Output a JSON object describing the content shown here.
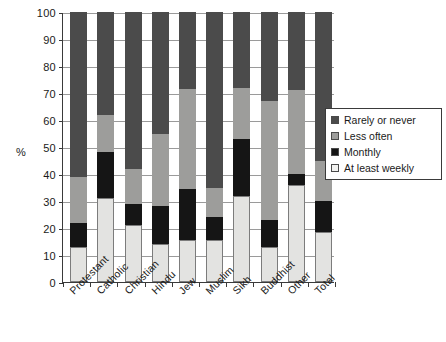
{
  "chart_data": {
    "type": "bar",
    "subtype": "stacked-bar-100",
    "title": "",
    "xlabel": "",
    "ylabel": "%",
    "ylim": [
      0,
      100
    ],
    "ytick_step": 10,
    "yticks": [
      100,
      90,
      80,
      70,
      60,
      50,
      40,
      30,
      20,
      10,
      0
    ],
    "grid": true,
    "legend_position": "right",
    "categories": [
      "Protestant",
      "Catholic",
      "Christian",
      "Hindu",
      "Jew",
      "Muslim",
      "Sikh",
      "Buddhist",
      "Other",
      "Total"
    ],
    "series": [
      {
        "name": "At least weekly",
        "color": "#e3e3e1",
        "values": [
          13,
          31,
          21,
          14,
          15.5,
          15.5,
          32,
          13,
          36,
          18.5
        ]
      },
      {
        "name": "Monthly",
        "color": "#151515",
        "values": [
          9,
          17,
          8,
          14,
          19,
          8.5,
          21,
          10,
          4,
          11.5
        ]
      },
      {
        "name": "Less often",
        "color": "#9d9d9b",
        "values": [
          17,
          14,
          13,
          27,
          37,
          11,
          19,
          44,
          31,
          15
        ]
      },
      {
        "name": "Rarely or never",
        "color": "#4b4b4b",
        "values": [
          61,
          38,
          58,
          45,
          28.5,
          65,
          28,
          33,
          29,
          55
        ]
      }
    ],
    "cumulative_tops": {
      "Protestant": [
        13,
        22,
        39,
        100
      ],
      "Catholic": [
        31,
        48,
        62,
        100
      ],
      "Christian": [
        21,
        29,
        42,
        100
      ],
      "Hindu": [
        14,
        28,
        55,
        100
      ],
      "Jew": [
        15.5,
        34.5,
        71.5,
        100
      ],
      "Muslim": [
        15.5,
        24,
        35,
        100
      ],
      "Sikh": [
        32,
        53,
        72,
        100
      ],
      "Buddhist": [
        13,
        23,
        67,
        100
      ],
      "Other": [
        36,
        40,
        71,
        100
      ],
      "Total": [
        18.5,
        30,
        45,
        100
      ]
    }
  },
  "legend": {
    "items": [
      {
        "label": "Rarely or never",
        "swatch": "sw-rarely"
      },
      {
        "label": "Less often",
        "swatch": "sw-less"
      },
      {
        "label": "Monthly",
        "swatch": "sw-monthly"
      },
      {
        "label": "At least weekly",
        "swatch": "sw-weekly"
      }
    ]
  }
}
